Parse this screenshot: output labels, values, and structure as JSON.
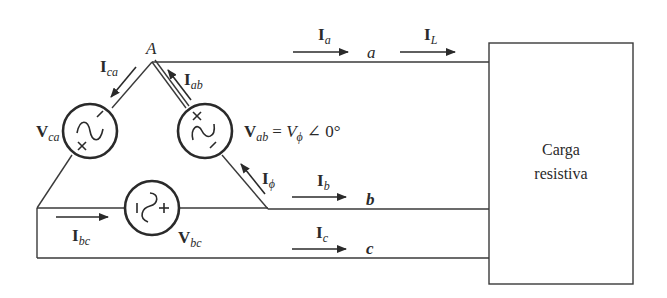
{
  "diagram": {
    "type": "circuit",
    "node": {
      "label": "A"
    },
    "sources": {
      "ca": {
        "main": "V",
        "sub": "ca"
      },
      "ab": {
        "main": "V",
        "sub": "ab",
        "equation_rhs_main": "= V",
        "equation_rhs_sub": "ϕ",
        "equation_angle": "∠ 0°"
      },
      "bc": {
        "main": "V",
        "sub": "bc"
      }
    },
    "currents": {
      "ca": {
        "main": "I",
        "sub": "ca"
      },
      "ab": {
        "main": "I",
        "sub": "ab"
      },
      "phi": {
        "main": "I",
        "sub": "ϕ"
      },
      "bc": {
        "main": "I",
        "sub": "bc"
      },
      "a": {
        "main": "I",
        "sub": "a"
      },
      "L": {
        "main": "I",
        "sub": "L"
      },
      "b": {
        "main": "I",
        "sub": "b"
      },
      "c": {
        "main": "I",
        "sub": "c"
      }
    },
    "lines": {
      "a": "a",
      "b": "b",
      "c": "c"
    },
    "polarity": {
      "plus": "+",
      "minus": "−"
    },
    "load": {
      "line1": "Carga",
      "line2": "resistiva"
    },
    "colors": {
      "ink": "#2a2a2a",
      "background": "#ffffff"
    }
  }
}
